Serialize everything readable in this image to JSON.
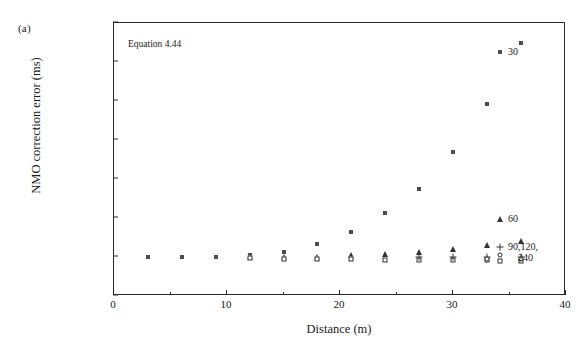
{
  "figure": {
    "panel_label": "(a)",
    "annotation": "Equation 4.44"
  },
  "chart_data": {
    "type": "scatter",
    "title": "",
    "xlabel": "Distance (m)",
    "ylabel": "NMO correction error (ms)",
    "xlim": [
      0,
      40
    ],
    "ylim": [
      -0.1,
      0.6
    ],
    "xticks": [
      0,
      10,
      20,
      30,
      40
    ],
    "xtick_labels": [
      "0",
      "10",
      "20",
      "30",
      "40"
    ],
    "x_minor_ticks": [
      5,
      15,
      25,
      35
    ],
    "yticks": [
      -0.1,
      0.0,
      0.1,
      0.2,
      0.3,
      0.4,
      0.5,
      0.6
    ],
    "ytick_labels": [
      "-0.1",
      "0.0",
      "0.1",
      "0.2",
      "0.3",
      "0.4",
      "0.5",
      "0.6"
    ],
    "grid": false,
    "legend_position": "inside-right",
    "series": [
      {
        "name": "30",
        "marker": "filled-square",
        "color": "#4d4d4d",
        "x": [
          3,
          6,
          9,
          12,
          15,
          18,
          21,
          24,
          27,
          30,
          33,
          36
        ],
        "y": [
          0.0,
          0.0,
          0.0,
          0.005,
          0.012,
          0.033,
          0.063,
          0.113,
          0.175,
          0.27,
          0.393,
          0.55
        ]
      },
      {
        "name": "60",
        "marker": "triangle",
        "color": "#333333",
        "x": [
          12,
          15,
          18,
          21,
          24,
          27,
          30,
          33,
          36
        ],
        "y": [
          0.0,
          0.0,
          0.0,
          0.005,
          0.008,
          0.012,
          0.02,
          0.03,
          0.042
        ]
      },
      {
        "name": "90,120,\n240",
        "marker": "open-square",
        "color": "#333333",
        "x": [
          12,
          15,
          18,
          21,
          24,
          27,
          30,
          33,
          36
        ],
        "y": [
          -0.003,
          -0.005,
          -0.006,
          -0.006,
          -0.007,
          -0.007,
          -0.008,
          -0.008,
          -0.009
        ]
      },
      {
        "name": "plus-overlay",
        "marker": "plus",
        "color": "#333333",
        "x": [
          27,
          30,
          33,
          36
        ],
        "y": [
          0.0,
          0.0,
          0.0,
          0.0
        ]
      },
      {
        "name": "circle-overlay",
        "marker": "circle",
        "color": "#333333",
        "x": [
          33,
          36
        ],
        "y": [
          -0.006,
          -0.006
        ]
      }
    ],
    "legend": [
      {
        "label": "30",
        "marker": "filled-square"
      },
      {
        "label": "60",
        "marker": "triangle"
      },
      {
        "label": "90,120,",
        "label2": "240",
        "marker": "plus-circle-square"
      }
    ]
  }
}
